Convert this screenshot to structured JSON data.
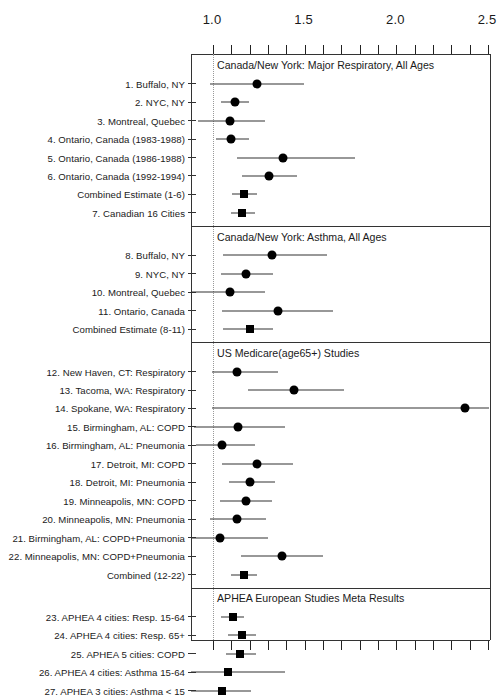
{
  "figure": {
    "type": "forest-plot",
    "axis": {
      "tick_labels": [
        "1.0",
        "1.5",
        "2.0",
        "2.5"
      ],
      "tick_values": [
        1.0,
        1.5,
        2.0,
        2.5
      ],
      "minor_tick_step": 0.1,
      "xlim": [
        0.88,
        2.51
      ],
      "reference_line": 1.0
    }
  },
  "chart_data": {
    "type": "scatter",
    "title": "",
    "xlabel": "",
    "ylabel": "",
    "xlim": [
      0.88,
      2.51
    ],
    "xticks": [
      1.0,
      1.5,
      2.0,
      2.5
    ],
    "xticklabels": [
      "1.0",
      "1.5",
      "2.0",
      "2.5"
    ],
    "minor_xtick_step": 0.1,
    "reference_line": 1.0,
    "grid": false,
    "legend": "none",
    "panels": [
      {
        "title": "Canada/New York: Major Respiratory, All Ages",
        "rows": [
          {
            "label": "1. Buffalo, NY",
            "estimate": 1.245,
            "low": 0.99,
            "high": 1.5,
            "marker": "circle"
          },
          {
            "label": "2. NYC, NY",
            "estimate": 1.125,
            "low": 1.05,
            "high": 1.2,
            "marker": "circle"
          },
          {
            "label": "3. Montreal, Quebec",
            "estimate": 1.1,
            "low": 0.925,
            "high": 1.29,
            "marker": "circle"
          },
          {
            "label": "4. Ontario, Canada (1983-1988)",
            "estimate": 1.105,
            "low": 1.02,
            "high": 1.2,
            "marker": "circle"
          },
          {
            "label": "5. Ontario, Canada (1986-1988)",
            "estimate": 1.39,
            "low": 1.135,
            "high": 1.78,
            "marker": "circle"
          },
          {
            "label": "6. Ontario, Canada (1992-1994)",
            "estimate": 1.31,
            "low": 1.165,
            "high": 1.465,
            "marker": "circle"
          },
          {
            "label": "Combined Estimate (1-6)",
            "estimate": 1.175,
            "low": 1.11,
            "high": 1.245,
            "marker": "square"
          },
          {
            "label": "7. Canadian 16 Cities",
            "estimate": 1.165,
            "low": 1.105,
            "high": 1.235,
            "marker": "square"
          }
        ]
      },
      {
        "title": "Canada/New York: Asthma, All Ages",
        "rows": [
          {
            "label": "8. Buffalo, NY",
            "estimate": 1.33,
            "low": 1.06,
            "high": 1.625,
            "marker": "circle"
          },
          {
            "label": "9. NYC, NY",
            "estimate": 1.185,
            "low": 1.05,
            "high": 1.335,
            "marker": "circle"
          },
          {
            "label": "10. Montreal, Quebec",
            "estimate": 1.1,
            "low": 0.885,
            "high": 1.29,
            "marker": "circle"
          },
          {
            "label": "11. Ontario, Canada",
            "estimate": 1.36,
            "low": 1.055,
            "high": 1.66,
            "marker": "circle"
          },
          {
            "label": "Combined Estimate (8-11)",
            "estimate": 1.205,
            "low": 1.06,
            "high": 1.335,
            "marker": "square"
          }
        ]
      },
      {
        "title": "US Medicare(age65+) Studies",
        "rows": [
          {
            "label": "12. New Haven, CT: Respiratory",
            "estimate": 1.135,
            "low": 1.0,
            "high": 1.36,
            "marker": "circle"
          },
          {
            "label": "13. Tacoma, WA: Respiratory",
            "estimate": 1.45,
            "low": 1.195,
            "high": 1.72,
            "marker": "circle"
          },
          {
            "label": "14. Spokane, WA: Respiratory",
            "estimate": 2.38,
            "low": 1.0,
            "high": 2.51,
            "marker": "circle"
          },
          {
            "label": "15. Birmingham, AL: COPD",
            "estimate": 1.14,
            "low": 0.9,
            "high": 1.4,
            "marker": "circle"
          },
          {
            "label": "16. Birmingham, AL: Pneumonia",
            "estimate": 1.055,
            "low": 0.915,
            "high": 1.235,
            "marker": "circle"
          },
          {
            "label": "17. Detroit, MI: COPD",
            "estimate": 1.245,
            "low": 1.055,
            "high": 1.44,
            "marker": "circle"
          },
          {
            "label": "18. Detroit, MI: Pneumonia",
            "estimate": 1.21,
            "low": 1.095,
            "high": 1.345,
            "marker": "circle"
          },
          {
            "label": "19. Minneapolis, MN: COPD",
            "estimate": 1.185,
            "low": 1.045,
            "high": 1.33,
            "marker": "circle"
          },
          {
            "label": "20. Minneapolis, MN: Pneumonia",
            "estimate": 1.135,
            "low": 0.99,
            "high": 1.295,
            "marker": "circle"
          },
          {
            "label": "21. Birmingham, AL: COPD+Pneumonia",
            "estimate": 1.045,
            "low": 0.885,
            "high": 1.305,
            "marker": "circle"
          },
          {
            "label": "22. Minneapolis, MN: COPD+Pneumonia",
            "estimate": 1.38,
            "low": 1.16,
            "high": 1.605,
            "marker": "circle"
          },
          {
            "label": "Combined (12-22)",
            "estimate": 1.175,
            "low": 1.105,
            "high": 1.245,
            "marker": "square"
          }
        ]
      },
      {
        "title": "APHEA European Studies Meta Results",
        "rows": [
          {
            "label": "23. APHEA 4 cities: Resp. 15-64",
            "estimate": 1.115,
            "low": 1.05,
            "high": 1.175,
            "marker": "square"
          },
          {
            "label": "24. APHEA 4 cities: Resp. 65+",
            "estimate": 1.165,
            "low": 1.09,
            "high": 1.24,
            "marker": "square"
          },
          {
            "label": "25. APHEA 5 cities: COPD",
            "estimate": 1.155,
            "low": 1.075,
            "high": 1.24,
            "marker": "square"
          },
          {
            "label": "26. APHEA 4 cities: Asthma 15-64",
            "estimate": 1.09,
            "low": 0.885,
            "high": 1.4,
            "marker": "square"
          },
          {
            "label": "27. APHEA 3 cities: Asthma < 15",
            "estimate": 1.055,
            "low": 0.885,
            "high": 1.215,
            "marker": "square"
          }
        ]
      }
    ]
  }
}
